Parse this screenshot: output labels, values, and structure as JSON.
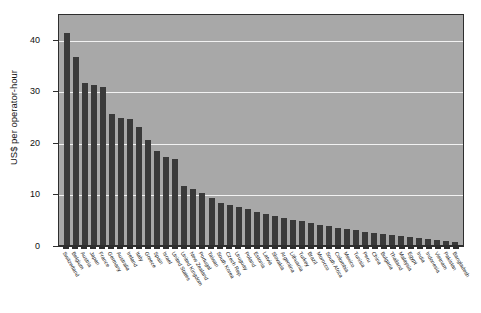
{
  "chart_data": {
    "type": "bar",
    "title": "",
    "subtitle": "",
    "xlabel": "",
    "ylabel": "US$ per operator-hour",
    "ylim": [
      0,
      45
    ],
    "yticks": [
      0,
      10,
      20,
      30,
      40
    ],
    "ytick_labels": [
      "0",
      "10",
      "20",
      "30",
      "40"
    ],
    "grid": "horizontal-white-gridlines",
    "legend": "none",
    "orientation": "vertical",
    "sorted": "descending",
    "categories": [
      "Switzerland",
      "Belgium",
      "Austria",
      "Japan",
      "France",
      "Germany",
      "Australia",
      "Ireland",
      "Italy",
      "Greece",
      "Spain",
      "Israel",
      "United States",
      "United Kingdom",
      "New Zealand",
      "Portugal",
      "Taiwan",
      "South Korea",
      "Czech Rep.",
      "Uruguay",
      "Poland",
      "Estonia",
      "Latvia",
      "Slovakia",
      "Argentina",
      "Lithuania",
      "Turkey",
      "Brazil",
      "Morocco",
      "South Africa",
      "Colombia",
      "Mexico",
      "Tunisia",
      "Peru",
      "China",
      "Bulgaria",
      "Thailand",
      "Malaysia",
      "Egypt",
      "India",
      "Indonesia",
      "Vietnam",
      "Pakistan",
      "Bangladesh"
    ],
    "values": [
      41.2,
      36.4,
      31.5,
      31.1,
      30.7,
      25.5,
      24.6,
      24.4,
      22.8,
      20.3,
      18.2,
      17.0,
      16.7,
      11.5,
      10.8,
      10.1,
      9.2,
      8.2,
      7.7,
      7.3,
      6.9,
      6.4,
      6.0,
      5.6,
      5.2,
      4.9,
      4.6,
      4.3,
      3.9,
      3.6,
      3.3,
      3.1,
      2.9,
      2.6,
      2.4,
      2.2,
      2.0,
      1.8,
      1.6,
      1.4,
      1.2,
      1.0,
      0.8,
      0.6
    ],
    "units": "US$ per operator-hour",
    "colors": {
      "bar": "#3a3a3a",
      "plot_background": "#a8a8a8",
      "gridline": "#f2f2f2",
      "axis": "#2e2e2e",
      "text": "#111111",
      "page_background": "#ffffff"
    }
  }
}
